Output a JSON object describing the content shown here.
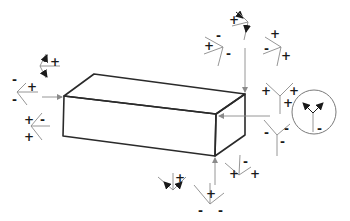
{
  "diagram": {
    "colors": {
      "box_edge": "#2a2a2a",
      "symbol_line": "#8a8a8a",
      "sign": "#1a1a1a"
    },
    "box": {
      "vertices": {
        "top_back_left": [
          94,
          74
        ],
        "top_back_right": [
          245,
          94
        ],
        "top_front_left": [
          64,
          96
        ],
        "top_front_right": [
          216,
          114
        ],
        "bottom_front_left": [
          63,
          136
        ],
        "bottom_front_right": [
          215,
          156
        ],
        "bottom_back_right": [
          245,
          135
        ]
      }
    },
    "symbols": [
      {
        "id": "top-left-arrows",
        "signs": [
          "+"
        ]
      },
      {
        "id": "left",
        "signs": [
          "-",
          "+",
          "-"
        ]
      },
      {
        "id": "left-lower",
        "signs": [
          "+",
          "-",
          "+"
        ]
      },
      {
        "id": "top-right-arrows",
        "signs": [
          "+"
        ]
      },
      {
        "id": "top-right-a",
        "signs": [
          "+",
          "-",
          "-"
        ]
      },
      {
        "id": "top-right-b",
        "signs": [
          "+",
          "-",
          "+"
        ]
      },
      {
        "id": "right-upper",
        "signs": [
          "+",
          "+",
          "+"
        ]
      },
      {
        "id": "right-lower",
        "signs": [
          "-",
          "-",
          "-"
        ]
      },
      {
        "id": "circle-detail",
        "signs": [
          "-"
        ]
      },
      {
        "id": "bottom-arrows",
        "signs": [
          "+"
        ]
      },
      {
        "id": "bottom-center",
        "signs": [
          "+",
          "-",
          "-"
        ]
      },
      {
        "id": "bottom-right",
        "signs": [
          "+",
          "-",
          "+"
        ]
      }
    ],
    "labels": {
      "plus": "+",
      "minus": "-"
    }
  }
}
